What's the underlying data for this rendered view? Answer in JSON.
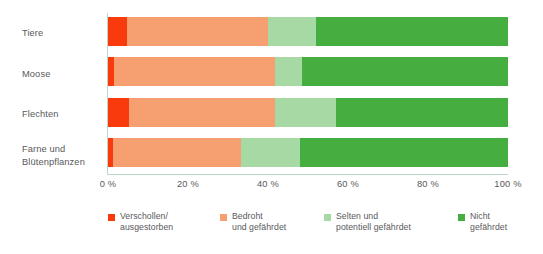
{
  "chart_data": {
    "type": "bar",
    "orientation": "horizontal",
    "stacked": true,
    "normalized": true,
    "title": "",
    "subtitle": "",
    "xlabel": "",
    "ylabel": "",
    "xlim": [
      0,
      100
    ],
    "grid": false,
    "legend_position": "bottom",
    "categories": [
      "Tiere",
      "Moose",
      "Flechten",
      "Farne und\nBlütenpflanzen"
    ],
    "series": [
      {
        "name": "Verschollen/\nausgestorben",
        "color": "#f93a0c",
        "values": [
          4.8,
          1.5,
          5.2,
          1.3
        ]
      },
      {
        "name": "Bedroht\nund gefährdet",
        "color": "#f6a072",
        "values": [
          35.2,
          40.2,
          36.5,
          32.0
        ]
      },
      {
        "name": "Selten und\npotentiell gefährdet",
        "color": "#a6d9a3",
        "values": [
          12.0,
          6.8,
          15.3,
          14.7
        ]
      },
      {
        "name": "Nicht gefährdet",
        "color": "#46ad41",
        "values": [
          48.0,
          51.5,
          43.0,
          52.0
        ]
      }
    ],
    "xticks": [
      {
        "value": 0,
        "label": "0 %"
      },
      {
        "value": 20,
        "label": "20 %"
      },
      {
        "value": 40,
        "label": "40 %"
      },
      {
        "value": 60,
        "label": "60 %"
      },
      {
        "value": 80,
        "label": "80 %"
      },
      {
        "value": 100,
        "label": "100 %"
      }
    ],
    "axis_color": "#b9d8c6",
    "text_color": "#58595b",
    "background": "#ffffff"
  }
}
